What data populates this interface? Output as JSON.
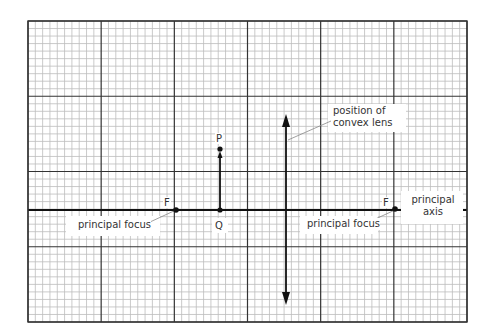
{
  "diagram": {
    "type": "ray-diagram-grid",
    "grid": {
      "major_columns": 6,
      "major_rows": 4,
      "minor_per_major": 10
    },
    "points": {
      "object_top": "P",
      "object_base": "Q",
      "focus_left": "F",
      "focus_right": "F"
    },
    "labels": {
      "lens_line1": "position of",
      "lens_line2": "convex lens",
      "principal_focus_left": "principal focus",
      "principal_focus_right": "principal focus",
      "axis_line1": "principal",
      "axis_line2": "axis"
    },
    "colors": {
      "ink": "#111111",
      "major_grid": "#333333",
      "minor_grid": "#bdbdbd",
      "text": "#333333"
    }
  }
}
